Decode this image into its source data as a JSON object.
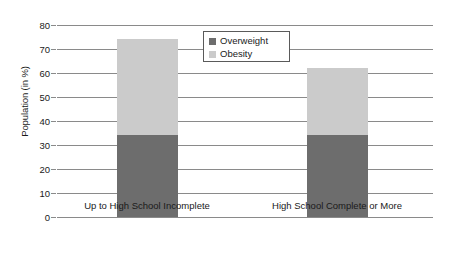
{
  "chart_data": {
    "type": "bar",
    "subtype": "stacked-bar",
    "title": "",
    "xlabel": "",
    "ylabel": "Population (in %)",
    "ylim": [
      0,
      80
    ],
    "yticks": [
      0,
      10,
      20,
      30,
      40,
      50,
      60,
      70,
      80
    ],
    "ytick_labels": [
      "0",
      "10",
      "20",
      "30",
      "40",
      "50",
      "60",
      "70",
      "80"
    ],
    "grid": true,
    "legend_position": "upper-center",
    "categories": [
      "Up to High School Incomplete",
      "High School Complete or More"
    ],
    "series": [
      {
        "name": "Overweight",
        "color": "#6d6d6d",
        "values": [
          34,
          34
        ]
      },
      {
        "name": "Obesity",
        "color": "#cbcbcb",
        "values": [
          40,
          28
        ]
      }
    ],
    "stack_totals": [
      74,
      62
    ]
  },
  "legend": {
    "items": [
      {
        "label": "Overweight",
        "color": "#6d6d6d"
      },
      {
        "label": "Obesity",
        "color": "#cbcbcb"
      }
    ]
  },
  "colors": {
    "overweight": "#6d6d6d",
    "obesity": "#cbcbcb",
    "gridline": "#8a8a8a",
    "text": "#1a1a1a",
    "background": "#ffffff"
  }
}
